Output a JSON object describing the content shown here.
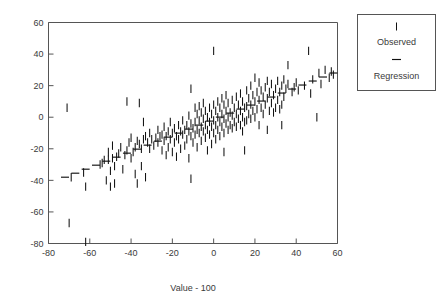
{
  "figure": {
    "background_color": "#ffffff",
    "ink_color": "#111111",
    "axis_color": "#555555"
  },
  "chart_data": {
    "type": "scatter",
    "title": "",
    "subtitle": "",
    "xlabel": "Value - 100",
    "ylabel": "",
    "xlim": [
      -80,
      60
    ],
    "ylim": [
      -80,
      60
    ],
    "xticks": [
      -80,
      -60,
      -40,
      -20,
      0,
      20,
      40,
      60
    ],
    "yticks": [
      -80,
      -60,
      -40,
      -20,
      0,
      20,
      40,
      60
    ],
    "xticklabels": [
      "-80",
      "-60",
      "-40",
      "-20",
      "0",
      "20",
      "40",
      "60"
    ],
    "yticklabels": [
      "-80",
      "-60",
      "-40",
      "-20",
      "0",
      "20",
      "40",
      "60"
    ],
    "grid": false,
    "legend_position": "outside-top-right",
    "marker_style": {
      "observed": "vertical-bar",
      "regression": "horizontal-dash"
    },
    "series": [
      {
        "name": "Observed",
        "marker": "vertical-bar",
        "points": [
          [
            -71,
            6
          ],
          [
            -70,
            -67
          ],
          [
            -69,
            -38
          ],
          [
            -63,
            -35
          ],
          [
            -62,
            -79
          ],
          [
            -62,
            -44
          ],
          [
            -55,
            -30
          ],
          [
            -54,
            -29
          ],
          [
            -53,
            -27
          ],
          [
            -52,
            -40
          ],
          [
            -51,
            -22
          ],
          [
            -51,
            -27
          ],
          [
            -50,
            -34
          ],
          [
            -50,
            -44
          ],
          [
            -49,
            -18
          ],
          [
            -49,
            -26
          ],
          [
            -48,
            -31
          ],
          [
            -48,
            -42
          ],
          [
            -47,
            -25
          ],
          [
            -46,
            -23
          ],
          [
            -45,
            -19
          ],
          [
            -44,
            -33
          ],
          [
            -43,
            -24
          ],
          [
            -42,
            10
          ],
          [
            -42,
            -21
          ],
          [
            -41,
            -16
          ],
          [
            -40,
            -26
          ],
          [
            -40,
            -13
          ],
          [
            -39,
            -22
          ],
          [
            -38,
            -19
          ],
          [
            -38,
            -36
          ],
          [
            -37,
            -15
          ],
          [
            -37,
            -42
          ],
          [
            -36,
            9
          ],
          [
            -36,
            -17
          ],
          [
            -35,
            -20
          ],
          [
            -35,
            -31
          ],
          [
            -34,
            -3
          ],
          [
            -34,
            -14
          ],
          [
            -33,
            -12
          ],
          [
            -33,
            -38
          ],
          [
            -32,
            -16
          ],
          [
            -31,
            -10
          ],
          [
            -31,
            -20
          ],
          [
            -30,
            -14
          ],
          [
            -29,
            -18
          ],
          [
            -28,
            -13
          ],
          [
            -27,
            -8
          ],
          [
            -27,
            -16
          ],
          [
            -26,
            -12
          ],
          [
            -25,
            -11
          ],
          [
            -25,
            -21
          ],
          [
            -24,
            -6
          ],
          [
            -24,
            -15
          ],
          [
            -23,
            -12
          ],
          [
            -23,
            -24
          ],
          [
            -22,
            -9
          ],
          [
            -22,
            -19
          ],
          [
            -21,
            -14
          ],
          [
            -21,
            -3
          ],
          [
            -20,
            -10
          ],
          [
            -20,
            -22
          ],
          [
            -19,
            -7
          ],
          [
            -19,
            -16
          ],
          [
            -18,
            -12
          ],
          [
            -18,
            -25
          ],
          [
            -17,
            -5
          ],
          [
            -17,
            -14
          ],
          [
            -16,
            -9
          ],
          [
            -16,
            -20
          ],
          [
            -15,
            -2
          ],
          [
            -15,
            -11
          ],
          [
            -14,
            -8
          ],
          [
            -14,
            -18
          ],
          [
            -13,
            -5
          ],
          [
            -13,
            -14
          ],
          [
            -12,
            1
          ],
          [
            -12,
            -9
          ],
          [
            -12,
            -26
          ],
          [
            -11,
            18
          ],
          [
            -11,
            -4
          ],
          [
            -11,
            -12
          ],
          [
            -11,
            -39
          ],
          [
            -10,
            -7
          ],
          [
            -10,
            -16
          ],
          [
            -9,
            6
          ],
          [
            -9,
            -3
          ],
          [
            -9,
            -11
          ],
          [
            -8,
            2
          ],
          [
            -8,
            -8
          ],
          [
            -8,
            -19
          ],
          [
            -7,
            7
          ],
          [
            -7,
            -2
          ],
          [
            -7,
            -10
          ],
          [
            -6,
            3
          ],
          [
            -6,
            -6
          ],
          [
            -6,
            -15
          ],
          [
            -5,
            9
          ],
          [
            -5,
            -1
          ],
          [
            -5,
            -9
          ],
          [
            -4,
            4
          ],
          [
            -4,
            -5
          ],
          [
            -4,
            -13
          ],
          [
            -3,
            0
          ],
          [
            -3,
            -8
          ],
          [
            -3,
            -21
          ],
          [
            -2,
            6
          ],
          [
            -2,
            -3
          ],
          [
            -2,
            -11
          ],
          [
            -1,
            2
          ],
          [
            -1,
            -6
          ],
          [
            -1,
            -17
          ],
          [
            0,
            42
          ],
          [
            0,
            8
          ],
          [
            0,
            -2
          ],
          [
            0,
            -10
          ],
          [
            1,
            4
          ],
          [
            1,
            -5
          ],
          [
            1,
            -14
          ],
          [
            2,
            10
          ],
          [
            2,
            0
          ],
          [
            2,
            -8
          ],
          [
            3,
            6
          ],
          [
            3,
            -3
          ],
          [
            3,
            -12
          ],
          [
            4,
            12
          ],
          [
            4,
            2
          ],
          [
            4,
            -6
          ],
          [
            5,
            8
          ],
          [
            5,
            -1
          ],
          [
            5,
            -10
          ],
          [
            5,
            -22
          ],
          [
            6,
            14
          ],
          [
            6,
            4
          ],
          [
            6,
            -4
          ],
          [
            7,
            9
          ],
          [
            7,
            0
          ],
          [
            7,
            -8
          ],
          [
            8,
            3
          ],
          [
            8,
            -5
          ],
          [
            9,
            11
          ],
          [
            9,
            1
          ],
          [
            9,
            -7
          ],
          [
            10,
            6
          ],
          [
            10,
            -3
          ],
          [
            11,
            13
          ],
          [
            11,
            2
          ],
          [
            11,
            -6
          ],
          [
            12,
            8
          ],
          [
            12,
            -1
          ],
          [
            13,
            15
          ],
          [
            13,
            4
          ],
          [
            13,
            -5
          ],
          [
            14,
            10
          ],
          [
            14,
            0
          ],
          [
            14,
            -9
          ],
          [
            15,
            6
          ],
          [
            15,
            -3
          ],
          [
            15,
            -21
          ],
          [
            16,
            17
          ],
          [
            16,
            7
          ],
          [
            16,
            -2
          ],
          [
            17,
            12
          ],
          [
            17,
            2
          ],
          [
            18,
            20
          ],
          [
            18,
            8
          ],
          [
            18,
            -1
          ],
          [
            19,
            14
          ],
          [
            19,
            4
          ],
          [
            20,
            25
          ],
          [
            20,
            10
          ],
          [
            20,
            0
          ],
          [
            21,
            16
          ],
          [
            21,
            5
          ],
          [
            22,
            22
          ],
          [
            22,
            11
          ],
          [
            22,
            -5
          ],
          [
            23,
            17
          ],
          [
            23,
            6
          ],
          [
            24,
            13
          ],
          [
            24,
            2
          ],
          [
            25,
            19
          ],
          [
            25,
            8
          ],
          [
            26,
            23
          ],
          [
            26,
            12
          ],
          [
            26,
            -8
          ],
          [
            27,
            16
          ],
          [
            27,
            4
          ],
          [
            28,
            21
          ],
          [
            28,
            9
          ],
          [
            29,
            14
          ],
          [
            29,
            3
          ],
          [
            30,
            18
          ],
          [
            30,
            6
          ],
          [
            31,
            23
          ],
          [
            31,
            11
          ],
          [
            32,
            16
          ],
          [
            32,
            5
          ],
          [
            33,
            20
          ],
          [
            33,
            8
          ],
          [
            33,
            -5
          ],
          [
            34,
            24
          ],
          [
            34,
            13
          ],
          [
            35,
            18
          ],
          [
            36,
            33
          ],
          [
            36,
            21
          ],
          [
            38,
            16
          ],
          [
            39,
            19
          ],
          [
            40,
            22
          ],
          [
            41,
            17
          ],
          [
            44,
            20
          ],
          [
            46,
            42
          ],
          [
            47,
            15
          ],
          [
            48,
            24
          ],
          [
            50,
            0
          ],
          [
            51,
            28
          ],
          [
            52,
            21
          ],
          [
            54,
            30
          ],
          [
            56,
            25
          ],
          [
            57,
            29
          ],
          [
            58,
            27
          ]
        ]
      }
    ],
    "regression": {
      "name": "Regression",
      "marker": "horizontal-dash",
      "x_start": -72,
      "y_start": -38,
      "x_end": 58,
      "y_end": 28,
      "slope": 0.5077,
      "intercept": -1.446
    }
  },
  "legend": {
    "entries": [
      {
        "label": "Observed",
        "marker": "vertical-bar"
      },
      {
        "label": "Regression",
        "marker": "horizontal-dash"
      }
    ]
  }
}
